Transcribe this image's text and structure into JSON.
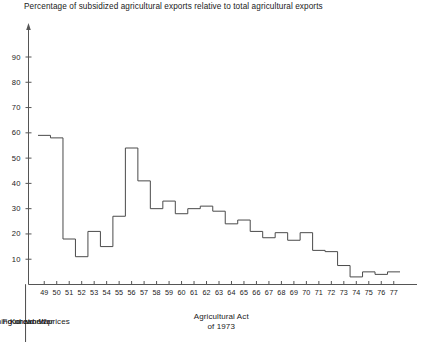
{
  "chart_data": {
    "type": "line",
    "subtype": "step",
    "title": "Percentage of subsidized agricultural exports relative to total agricultural exports",
    "xlabel": "",
    "ylabel": "",
    "ylim": [
      0,
      100
    ],
    "xlim": [
      49,
      78
    ],
    "grid": false,
    "legend": null,
    "y_ticks": [
      10,
      20,
      30,
      40,
      50,
      60,
      70,
      80,
      90
    ],
    "x_ticks": [
      "49",
      "50",
      "51",
      "52",
      "53",
      "54",
      "55",
      "56",
      "57",
      "58",
      "59",
      "60",
      "61",
      "62",
      "63",
      "64",
      "65",
      "66",
      "67",
      "68",
      "69",
      "70",
      "71",
      "72",
      "73",
      "74",
      "75",
      "76",
      "77"
    ],
    "categories": [
      1949,
      1950,
      1951,
      1952,
      1953,
      1954,
      1955,
      1956,
      1957,
      1958,
      1959,
      1960,
      1961,
      1962,
      1963,
      1964,
      1965,
      1966,
      1967,
      1968,
      1969,
      1970,
      1971,
      1972,
      1973,
      1974,
      1975,
      1976,
      1977
    ],
    "values": [
      59,
      58,
      18,
      11,
      21,
      15,
      27,
      54,
      41,
      30,
      33,
      28,
      30,
      31,
      29,
      24,
      25.5,
      21,
      18.5,
      20.5,
      17.5,
      20.5,
      13.5,
      13,
      7.5,
      3,
      5,
      4,
      5
    ],
    "annotations": [
      {
        "label": "Korean War",
        "start": 49,
        "end": 55
      },
      {
        "label": "Food aid era",
        "start": 55,
        "end": 63
      },
      {
        "label": "Opening on world prices",
        "start": 63,
        "end": 74
      },
      {
        "label": "Agricultural Act of 1973",
        "start": 74,
        "end": 78
      }
    ],
    "eras": [
      {
        "name": "era-korean-war",
        "line1": "Korean War",
        "line2": ""
      },
      {
        "name": "era-food-aid",
        "line1": "Food aid era",
        "line2": ""
      },
      {
        "name": "era-world-prices",
        "line1": "Opening on world prices",
        "line2": ""
      },
      {
        "name": "era-ag-act",
        "line1": "Agricultural Act",
        "line2": "of 1973"
      }
    ],
    "colors": {
      "line": "#4a4a4a",
      "axis": "#555555",
      "text": "#1a1a1a",
      "background": "#ffffff"
    }
  }
}
